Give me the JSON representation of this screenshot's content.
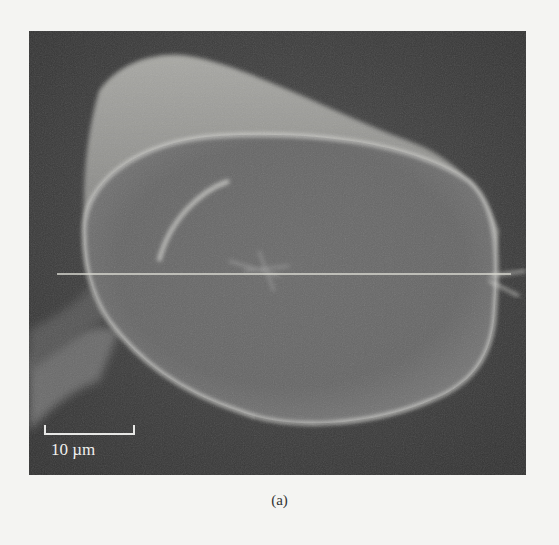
{
  "figure": {
    "type": "SEM micrograph",
    "scale_bar": {
      "label": "10 µm"
    },
    "caption": "(a)",
    "measurement_line": {
      "orientation": "horizontal",
      "color": "#d8d8d0"
    }
  },
  "colors": {
    "page_background": "#f4f4f2",
    "image_background": "#3b3b3b",
    "fiber_surface": "#6e6e6e",
    "edge_highlight": "#e0e0dc"
  }
}
